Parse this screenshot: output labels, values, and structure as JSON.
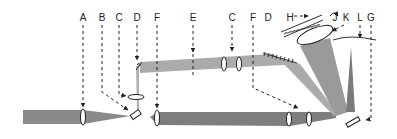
{
  "diagram": {
    "type": "optical-setup-schematic",
    "labels": [
      {
        "id": "label-a",
        "text": "A",
        "x": 83,
        "y": 20
      },
      {
        "id": "label-b",
        "text": "B",
        "x": 102,
        "y": 20
      },
      {
        "id": "label-c1",
        "text": "C",
        "x": 119,
        "y": 20
      },
      {
        "id": "label-d1",
        "text": "D",
        "x": 137,
        "y": 20
      },
      {
        "id": "label-f1",
        "text": "F",
        "x": 157,
        "y": 20
      },
      {
        "id": "label-e",
        "text": "E",
        "x": 193,
        "y": 20
      },
      {
        "id": "label-c2",
        "text": "C",
        "x": 232,
        "y": 20
      },
      {
        "id": "label-f2",
        "text": "F",
        "x": 253,
        "y": 20
      },
      {
        "id": "label-d2",
        "text": "D",
        "x": 268,
        "y": 20
      },
      {
        "id": "label-h",
        "text": "H",
        "x": 291,
        "y": 20
      },
      {
        "id": "label-j",
        "text": "J",
        "x": 335,
        "y": 20
      },
      {
        "id": "label-k",
        "text": "K",
        "x": 346,
        "y": 20
      },
      {
        "id": "label-l",
        "text": "L",
        "x": 360,
        "y": 20
      },
      {
        "id": "label-g",
        "text": "G",
        "x": 371,
        "y": 20
      }
    ],
    "colors": {
      "beam_dark": "#7a7a7a",
      "beam_light": "#a8a8a8",
      "beam_mid": "#8e8e8e",
      "line": "#222222",
      "background": "#ffffff"
    }
  }
}
